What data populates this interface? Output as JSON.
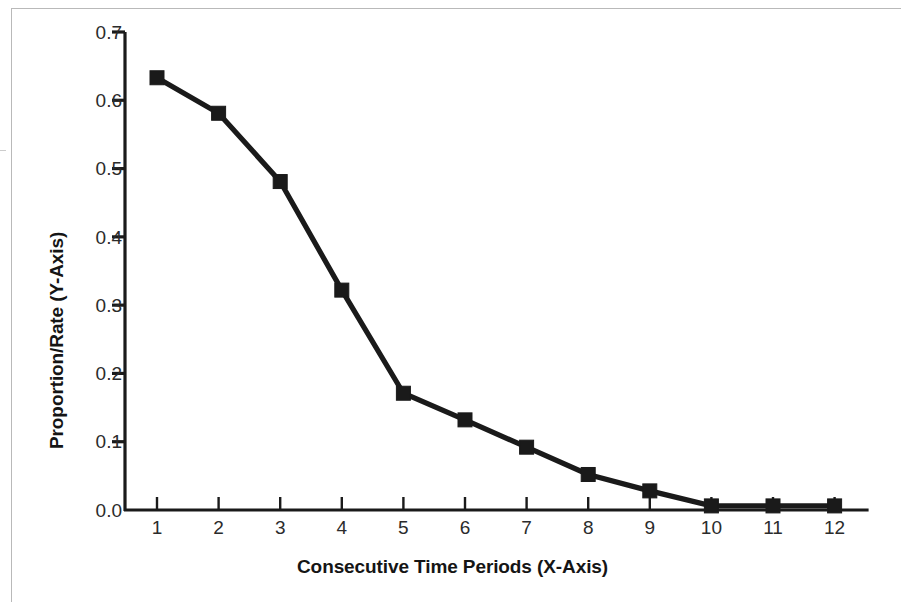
{
  "chart_data": {
    "type": "line",
    "title": "",
    "subtitle": "",
    "xlabel": "Consecutive Time Periods (X-Axis)",
    "ylabel": "Proportion/Rate (Y-Axis)",
    "x": [
      1,
      2,
      3,
      4,
      5,
      6,
      7,
      8,
      9,
      10,
      11,
      12
    ],
    "categories": [
      "1",
      "2",
      "3",
      "4",
      "5",
      "6",
      "7",
      "8",
      "9",
      "10",
      "11",
      "12"
    ],
    "values": [
      0.633,
      0.581,
      0.481,
      0.322,
      0.171,
      0.132,
      0.092,
      0.052,
      0.028,
      0.006,
      0.006,
      0.006
    ],
    "series": [
      {
        "name": "",
        "values": [
          0.633,
          0.581,
          0.481,
          0.322,
          0.171,
          0.132,
          0.092,
          0.052,
          0.028,
          0.006,
          0.006,
          0.006
        ]
      }
    ],
    "xlim": [
      0.5,
      12.5
    ],
    "ylim": [
      0.0,
      0.7
    ],
    "ytick_labels": [
      "0.7",
      "0.6",
      "0.5",
      "0.4",
      "0.3",
      "0.2",
      "0.1",
      "0.0"
    ],
    "ytick_values": [
      0.7,
      0.6,
      0.5,
      0.4,
      0.3,
      0.2,
      0.1,
      0.0
    ],
    "xtick_labels": [
      "1",
      "2",
      "3",
      "4",
      "5",
      "6",
      "7",
      "8",
      "9",
      "10",
      "11",
      "12"
    ],
    "grid": false,
    "legend": false,
    "legend_position": "none",
    "marker": "square",
    "line_color": "#1a1a1a",
    "marker_color": "#1a1a1a",
    "axis_color": "#1a1a1a",
    "background_color": "#ffffff",
    "frame_color": "#b9b9b9"
  },
  "figure": {
    "ghost_caption": ""
  }
}
